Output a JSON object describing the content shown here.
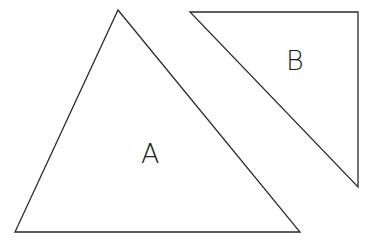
{
  "figure": {
    "background_color": "#ffffff",
    "width": 375,
    "height": 246,
    "stroke_color": "#2b2b2b",
    "stroke_width": 1.3,
    "label_color": "#1f1f1f"
  },
  "shapes": [
    {
      "id": "triangle-a",
      "label": "A",
      "kind": "triangle",
      "points": "118,10 300,232 15,232",
      "vertices": [
        {
          "name": "apex",
          "x": 118,
          "y": 10
        },
        {
          "name": "bottom-right",
          "x": 300,
          "y": 232
        },
        {
          "name": "bottom-left",
          "x": 15,
          "y": 232
        }
      ],
      "label_position": {
        "x": 141,
        "y": 163
      },
      "label_font_size": 27
    },
    {
      "id": "triangle-b",
      "label": "B",
      "kind": "triangle",
      "points": "190,12 358,12 358,187",
      "vertices": [
        {
          "name": "top-left",
          "x": 190,
          "y": 12
        },
        {
          "name": "top-right",
          "x": 358,
          "y": 12
        },
        {
          "name": "bottom-right",
          "x": 358,
          "y": 187
        }
      ],
      "label_position": {
        "x": 286,
        "y": 70
      },
      "label_font_size": 27
    }
  ]
}
